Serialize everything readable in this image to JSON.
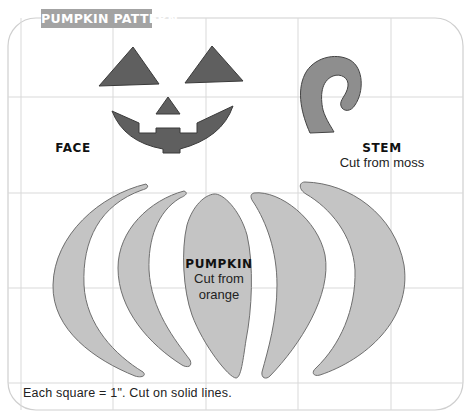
{
  "title": "PUMPKIN PATTERN",
  "colors": {
    "grid": "#d6d6d6",
    "border": "#cfcfcf",
    "banner": "#a3a3a3",
    "face_fill": "#5f5f5f",
    "stem_fill": "#8e8e8e",
    "pumpkin_fill": "#c4c4c4",
    "outline": "#555555"
  },
  "pieces": {
    "face": {
      "label": "FACE",
      "instruction": ""
    },
    "stem": {
      "label": "STEM",
      "instruction": "Cut from moss"
    },
    "pumpkin": {
      "label": "PUMPKIN",
      "instruction_line1": "Cut from",
      "instruction_line2": "orange"
    }
  },
  "footer": "Each square = 1\". Cut on solid lines.",
  "grid": {
    "square_size": "1\""
  }
}
